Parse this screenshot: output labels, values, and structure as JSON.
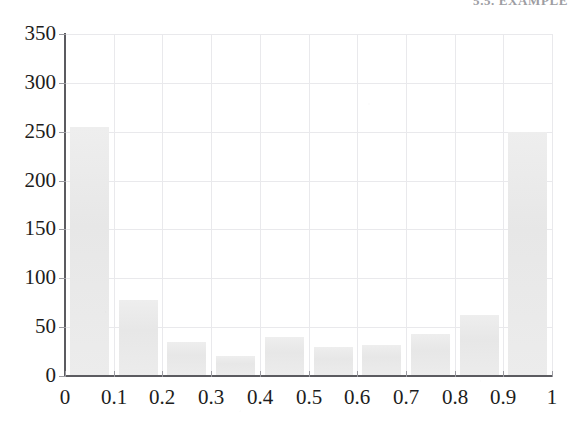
{
  "page_header": {
    "text": "5.5. EXAMPLE",
    "note": "cut-off running head at top edge of scanned page"
  },
  "colors": {
    "bar_fill": "#ebebeb",
    "axis": "#5b5b60",
    "grid": "#e9e9ec",
    "tick_label": "#1d1d20",
    "page_background": "#ffffff"
  },
  "chart_data": {
    "type": "bar",
    "title": "",
    "subtitle": "",
    "xlabel": "",
    "ylabel": "",
    "xlim": [
      0,
      1
    ],
    "ylim": [
      0,
      350
    ],
    "grid": true,
    "legend": null,
    "legend_position": "none",
    "bar_style": "histogram, contiguous bins of width 0.1",
    "x_tick_labels": [
      "0",
      "0.1",
      "0.2",
      "0.3",
      "0.4",
      "0.5",
      "0.6",
      "0.7",
      "0.8",
      "0.9",
      "1"
    ],
    "x_tick_values": [
      0,
      0.1,
      0.2,
      0.3,
      0.4,
      0.5,
      0.6,
      0.7,
      0.8,
      0.9,
      1
    ],
    "y_tick_labels": [
      "0",
      "50",
      "100",
      "150",
      "200",
      "250",
      "300",
      "350"
    ],
    "y_tick_values": [
      0,
      50,
      100,
      150,
      200,
      250,
      300,
      350
    ],
    "categories": [
      "0.0-0.1",
      "0.1-0.2",
      "0.2-0.3",
      "0.3-0.4",
      "0.4-0.5",
      "0.5-0.6",
      "0.6-0.7",
      "0.7-0.8",
      "0.8-0.9",
      "0.9-1.0"
    ],
    "bin_edges": [
      0.0,
      0.1,
      0.2,
      0.3,
      0.4,
      0.5,
      0.6,
      0.7,
      0.8,
      0.9,
      1.0
    ],
    "values": [
      255,
      78,
      35,
      20,
      40,
      30,
      32,
      43,
      62,
      250
    ],
    "bars": [
      {
        "bin_start": 0.0,
        "bin_end": 0.1,
        "value": 255
      },
      {
        "bin_start": 0.1,
        "bin_end": 0.2,
        "value": 78
      },
      {
        "bin_start": 0.2,
        "bin_end": 0.3,
        "value": 35
      },
      {
        "bin_start": 0.3,
        "bin_end": 0.4,
        "value": 20
      },
      {
        "bin_start": 0.4,
        "bin_end": 0.5,
        "value": 40
      },
      {
        "bin_start": 0.5,
        "bin_end": 0.6,
        "value": 30
      },
      {
        "bin_start": 0.6,
        "bin_end": 0.7,
        "value": 32
      },
      {
        "bin_start": 0.7,
        "bin_end": 0.8,
        "value": 43
      },
      {
        "bin_start": 0.8,
        "bin_end": 0.9,
        "value": 62
      },
      {
        "bin_start": 0.9,
        "bin_end": 1.0,
        "value": 250
      }
    ]
  }
}
